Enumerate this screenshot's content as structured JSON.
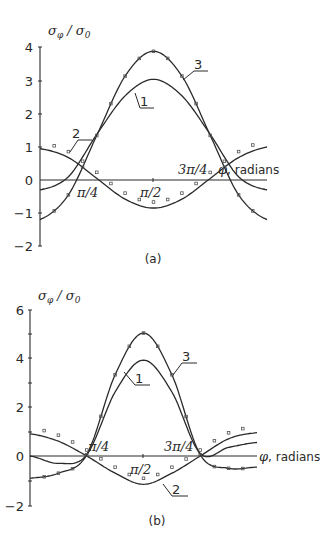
{
  "chart_data": [
    {
      "panel": "(a)",
      "type": "line",
      "ylabel": "σφ / σ0",
      "xlabel": "φ, radians",
      "ylim": [
        -2,
        4
      ],
      "yticks": [
        "4",
        "3",
        "2",
        "1",
        "0",
        "-1",
        "-2"
      ],
      "xticks": [
        "π/4",
        "π/2",
        "3π/4"
      ],
      "x": [
        0,
        0.3927,
        0.7854,
        1.1781,
        1.5708,
        1.9635,
        2.3562,
        2.7489,
        3.1416
      ],
      "series": [
        {
          "name": "1",
          "values": [
            -0.3,
            0.1,
            1.38,
            2.55,
            3.05,
            2.55,
            1.38,
            0.1,
            -0.3
          ]
        },
        {
          "name": "2",
          "values": [
            0.95,
            0.68,
            0.05,
            -0.58,
            -0.85,
            -0.58,
            0.05,
            0.68,
            1.0
          ]
        },
        {
          "name": "3",
          "values": [
            -1.2,
            -0.45,
            1.35,
            3.15,
            3.9,
            3.15,
            1.35,
            -0.45,
            -1.2
          ]
        }
      ],
      "grid": false,
      "legend": "curve number labels with leader lines"
    },
    {
      "panel": "(b)",
      "type": "line",
      "ylabel": "σφ / σ0",
      "xlabel": "φ, radians",
      "ylim": [
        -2,
        6
      ],
      "yticks": [
        "6",
        "4",
        "2",
        "0",
        "-2"
      ],
      "xticks": [
        "π/4",
        "π/2",
        "3π/4"
      ],
      "x": [
        0,
        0.3927,
        0.7854,
        1.1781,
        1.5708,
        1.9635,
        2.3562,
        2.7489,
        3.1416
      ],
      "series": [
        {
          "name": "1",
          "values": [
            0.0,
            -0.3,
            0.05,
            2.6,
            3.9,
            2.6,
            0.1,
            0.35,
            0.55
          ]
        },
        {
          "name": "2",
          "values": [
            0.9,
            0.6,
            0.0,
            -0.7,
            -1.15,
            -0.7,
            0.0,
            0.7,
            0.95
          ]
        },
        {
          "name": "3",
          "values": [
            -0.9,
            -0.7,
            0.05,
            3.3,
            5.0,
            3.3,
            0.05,
            -0.5,
            -0.45
          ]
        }
      ],
      "grid": false,
      "legend": "curve number labels with leader lines"
    }
  ],
  "labels": {
    "ylabel_sigma": "σ",
    "ylabel_sub_phi": "φ",
    "ylabel_slash": " / σ",
    "ylabel_sub_0": "0",
    "xlabel_phi": "φ",
    "xlabel_text": ", radians",
    "pi4": "π/4",
    "pi2": "π/2",
    "pi34": "3π/4",
    "panel_a": "(a)",
    "panel_b": "(b)",
    "curve1": "1",
    "curve2": "2",
    "curve3": "3"
  },
  "ticks_a": [
    "4",
    "3",
    "2",
    "1",
    "0",
    "−1",
    "−2"
  ],
  "ticks_b": [
    "6",
    "4",
    "2",
    "0",
    "−2"
  ]
}
